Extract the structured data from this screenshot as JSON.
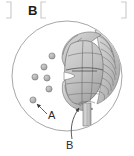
{
  "figure": {
    "panel_label": "B",
    "canvas": {
      "width": 134,
      "height": 156
    },
    "background_color": "#ffffff"
  },
  "bracket": {
    "name": "panel-bracket",
    "color": "#c9c9c9",
    "left_tail_x": 8,
    "open_x": 44,
    "close_x": 126,
    "top_y": 2,
    "bottom_y": 20
  },
  "specimen_frame": {
    "shape": "circle",
    "center_x": 67,
    "center_y": 76,
    "radius": 55,
    "stroke_color": "#9d9d9d",
    "fill_color": "#ffffff"
  },
  "organ": {
    "name": "strobilus-body",
    "description": "scaled cone-like organ with stem",
    "center_x": 84,
    "center_y": 71,
    "fill_light": "#d2d2d2",
    "fill_mid": "#b4b4b4",
    "fill_dark": "#9a9a9a",
    "outline_color": "#6f6f6f",
    "scale_count": 14,
    "stem": {
      "x": 87,
      "top_y": 104,
      "bottom_y": 124,
      "width": 7
    }
  },
  "granules": {
    "name": "spore-granules",
    "count": 6,
    "fill_color": "#b0b0b0",
    "stroke_color": "#7a7a7a",
    "radius": 3.1,
    "positions": [
      {
        "cx": 52,
        "cy": 56
      },
      {
        "cx": 44,
        "cy": 67
      },
      {
        "cx": 35,
        "cy": 77
      },
      {
        "cx": 47,
        "cy": 78
      },
      {
        "cx": 49,
        "cy": 89
      },
      {
        "cx": 33,
        "cy": 100
      }
    ]
  },
  "callouts": [
    {
      "id": "A",
      "label": "A",
      "label_x": 50,
      "label_y": 117,
      "target_x": 36,
      "target_y": 103,
      "leader_color": "#4a4a4a"
    },
    {
      "id": "B",
      "label": "B",
      "label_x": 69,
      "label_y": 146,
      "target_x": 79,
      "target_y": 106,
      "leader_color": "#4a4a4a"
    }
  ],
  "colors": {
    "ink": "#1c1c1c",
    "callout_ink": "#2a2a2a",
    "frame_stroke": "#9d9d9d",
    "bracket_stroke": "#c9c9c9",
    "organ_outline": "#6f6f6f",
    "granule_fill": "#b0b0b0"
  }
}
